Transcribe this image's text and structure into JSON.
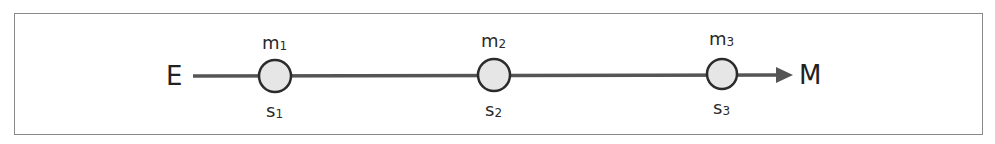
{
  "diagram": {
    "start_label": "E",
    "end_label": "M",
    "nodes": [
      {
        "mass_label": "m",
        "mass_sub": "1",
        "state_label": "s",
        "state_sub": "1"
      },
      {
        "mass_label": "m",
        "mass_sub": "2",
        "state_label": "s",
        "state_sub": "2"
      },
      {
        "mass_label": "m",
        "mass_sub": "3",
        "state_label": "s",
        "state_sub": "3"
      }
    ],
    "colors": {
      "line": "#555555",
      "node_fill": "#e6e6e6",
      "node_stroke": "#2b2b2b",
      "frame": "#8a8a8a",
      "text": "#222222"
    }
  }
}
